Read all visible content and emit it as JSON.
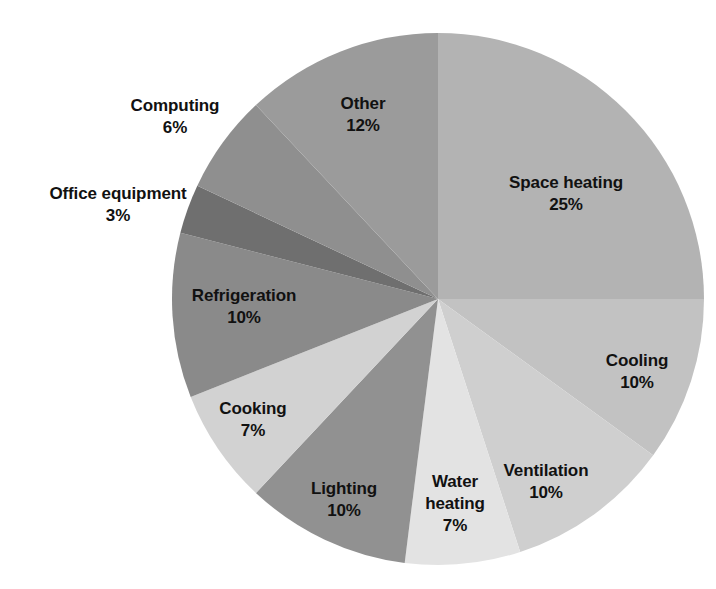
{
  "chart_data": {
    "type": "pie",
    "title": "",
    "subtitle": "",
    "xlabel": "",
    "ylabel": "",
    "legend_position": "none",
    "grid": false,
    "value_suffix": "%",
    "start_angle_deg": 0,
    "direction": "clockwise",
    "categories": [
      "Space heating",
      "Cooling",
      "Ventilation",
      "Water heating",
      "Lighting",
      "Cooking",
      "Refrigeration",
      "Office equipment",
      "Computing",
      "Other"
    ],
    "values": [
      25,
      10,
      10,
      7,
      10,
      7,
      10,
      3,
      6,
      12
    ],
    "colors": [
      "#b3b3b3",
      "#c2c2c2",
      "#cfcfcf",
      "#e3e3e3",
      "#919191",
      "#d2d2d2",
      "#8a8a8a",
      "#6f6f6f",
      "#8f8f8f",
      "#9b9b9b"
    ],
    "slices": [
      {
        "label": "Space heating",
        "value": 25,
        "value_text": "25%",
        "color": "#b3b3b3",
        "label_placement": "inside"
      },
      {
        "label": "Cooling",
        "value": 10,
        "value_text": "10%",
        "color": "#c2c2c2",
        "label_placement": "inside"
      },
      {
        "label": "Ventilation",
        "value": 10,
        "value_text": "10%",
        "color": "#cfcfcf",
        "label_placement": "inside"
      },
      {
        "label": "Water heating",
        "value": 7,
        "value_text": "7%",
        "color": "#e3e3e3",
        "label_placement": "inside"
      },
      {
        "label": "Lighting",
        "value": 10,
        "value_text": "10%",
        "color": "#919191",
        "label_placement": "inside"
      },
      {
        "label": "Cooking",
        "value": 7,
        "value_text": "7%",
        "color": "#d2d2d2",
        "label_placement": "inside"
      },
      {
        "label": "Refrigeration",
        "value": 10,
        "value_text": "10%",
        "color": "#8a8a8a",
        "label_placement": "inside"
      },
      {
        "label": "Office equipment",
        "value": 3,
        "value_text": "3%",
        "color": "#6f6f6f",
        "label_placement": "outside"
      },
      {
        "label": "Computing",
        "value": 6,
        "value_text": "6%",
        "color": "#8f8f8f",
        "label_placement": "outside"
      },
      {
        "label": "Other",
        "value": 12,
        "value_text": "12%",
        "color": "#9b9b9b",
        "label_placement": "inside"
      }
    ]
  },
  "labels": {
    "space_heating": {
      "name": "Space heating",
      "value": "25%"
    },
    "cooling": {
      "name": "Cooling",
      "value": "10%"
    },
    "ventilation": {
      "name": "Ventilation",
      "value": "10%"
    },
    "water_heating_line1": "Water",
    "water_heating_line2": "heating",
    "water_heating_value": "7%",
    "lighting": {
      "name": "Lighting",
      "value": "10%"
    },
    "cooking": {
      "name": "Cooking",
      "value": "7%"
    },
    "refrigeration": {
      "name": "Refrigeration",
      "value": "10%"
    },
    "office_equipment": {
      "name": "Office equipment",
      "value": "3%"
    },
    "computing": {
      "name": "Computing",
      "value": "6%"
    },
    "other": {
      "name": "Other",
      "value": "12%"
    }
  },
  "geometry": {
    "center_x": 438,
    "center_y": 299,
    "radius": 266
  }
}
